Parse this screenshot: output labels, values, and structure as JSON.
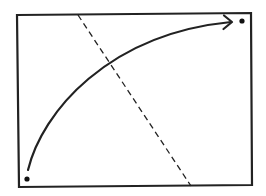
{
  "diagram": {
    "type": "geometric-figure",
    "colors": {
      "background": "#ffffff",
      "stroke": "#222222",
      "dot": "#111111"
    },
    "frame": {
      "points": "17,15 251,13 252,185 19,187",
      "stroke_width": 2.2
    },
    "dashed_line": {
      "x1": 78,
      "y1": 15,
      "x2": 191,
      "y2": 186,
      "dash": "6,4",
      "stroke_width": 1.3
    },
    "curve_arrow": {
      "path": "M 28 170 C 42 112, 108 34, 231 22",
      "stroke_width": 2.2,
      "arrowhead": "M 224 15.5 L 232 22 L 223.5 29"
    },
    "dots": [
      {
        "name": "start-point",
        "cx": 27,
        "cy": 179,
        "r": 2.6
      },
      {
        "name": "end-point",
        "cx": 242,
        "cy": 21,
        "r": 2.6
      }
    ]
  }
}
